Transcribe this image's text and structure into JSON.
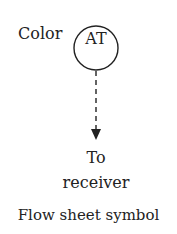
{
  "diagram": {
    "side_label": "Color",
    "instrument_tag": "AT",
    "destination_line1": "To",
    "destination_line2": "receiver",
    "caption": "Flow sheet symbol",
    "line_style": "dashed",
    "stroke_color": "#222222"
  }
}
